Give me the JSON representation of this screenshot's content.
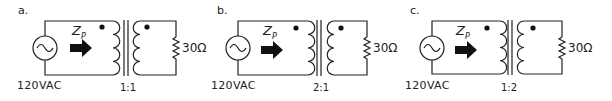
{
  "circuits": [
    {
      "label": "a.",
      "source_voltage": "120VAC",
      "impedance_label": "Z",
      "impedance_subscript": "P",
      "turns_ratio": "1:1",
      "load_resistance": "30Ω"
    },
    {
      "label": "b.",
      "source_voltage": "120VAC",
      "impedance_label": "Z",
      "impedance_subscript": "P",
      "turns_ratio": "2:1",
      "load_resistance": "30Ω"
    },
    {
      "label": "c.",
      "source_voltage": "120VAC",
      "impedance_label": "Z",
      "impedance_subscript": "P",
      "turns_ratio": "1:2",
      "load_resistance": "30Ω"
    }
  ]
}
